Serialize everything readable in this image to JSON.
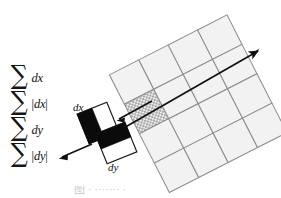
{
  "figure": {
    "type": "surf-descriptor-diagram",
    "background_color": "#ffffff"
  },
  "sums": {
    "heading": "",
    "items": [
      {
        "symbol": "∑",
        "term_prefix": "",
        "term_var": "dx",
        "term_suffix": "",
        "label": "sum dx"
      },
      {
        "symbol": "∑",
        "term_prefix": "|",
        "term_var": "dx",
        "term_suffix": "|",
        "label": "sum abs dx"
      },
      {
        "symbol": "∑",
        "term_prefix": "",
        "term_var": "dy",
        "term_suffix": "",
        "label": "sum dy"
      },
      {
        "symbol": "∑",
        "term_prefix": "|",
        "term_var": "dy",
        "term_suffix": "|",
        "label": "sum abs dy"
      }
    ]
  },
  "filters": {
    "dx": {
      "label": "dx",
      "description": "vertical Haar wavelet, black left half, white right half",
      "dark_color": "#0b0b0b",
      "light_color": "#ffffff",
      "stroke_color": "#1a1a1a"
    },
    "dy": {
      "label": "dy",
      "description": "horizontal Haar wavelet, black top half, white bottom half",
      "dark_color": "#0b0b0b",
      "light_color": "#ffffff",
      "stroke_color": "#1a1a1a"
    }
  },
  "grid": {
    "rows": 4,
    "columns": 4,
    "rotation_degrees": -27,
    "cell_fill": "#f2f2f2",
    "cell_stroke": "#8d8d8d",
    "highlight_cell": {
      "row": 1,
      "column": 0,
      "pattern": "dotted-checker",
      "fill": "#c9c9c9"
    }
  },
  "arrows": {
    "orientation_axis": {
      "name": "dominant orientation axis",
      "style": "double-headed",
      "color": "#111111"
    },
    "callout": {
      "name": "callout arrow to filter pair",
      "style": "single-headed",
      "color": "#111111"
    }
  },
  "caption": {
    "text": "图  ·  ·······  ·"
  },
  "colors": {
    "ink": "#111111",
    "grid_line": "#8d8d8d",
    "grid_fill": "#f2f2f2",
    "highlight": "#c9c9c9",
    "caption_gray": "#c9c9c9"
  }
}
